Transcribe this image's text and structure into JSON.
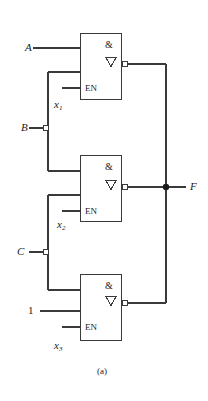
{
  "figure": {
    "caption": "(a)",
    "stroke_color": "#3a3a3a",
    "bg_color": "#ffffff"
  },
  "circuit": {
    "type": "three-state-and-gate-network",
    "gate_symbol": "&",
    "three_state_symbol": "∇",
    "enable_label": "EN",
    "output_label": "F",
    "gates": [
      {
        "id": "gate-top",
        "symbol": "&",
        "three_state": "∇",
        "enable": "EN",
        "inputs": [
          "A",
          "x1-feedback",
          "EN"
        ],
        "inverted_output": true
      },
      {
        "id": "gate-middle",
        "symbol": "&",
        "three_state": "∇",
        "enable": "EN",
        "inputs": [
          "x1",
          "x2-feedback",
          "EN"
        ],
        "inverted_output": true
      },
      {
        "id": "gate-bottom",
        "symbol": "&",
        "three_state": "∇",
        "enable": "EN",
        "inputs": [
          "x2",
          "1",
          "EN"
        ],
        "inverted_output": true
      }
    ],
    "signals": {
      "a": "A",
      "b": "B",
      "c": "C",
      "const_one": "1",
      "x1": "x",
      "x1_sub": "1",
      "x2": "x",
      "x2_sub": "2",
      "x3": "x",
      "x3_sub": "3",
      "f": "F"
    }
  }
}
